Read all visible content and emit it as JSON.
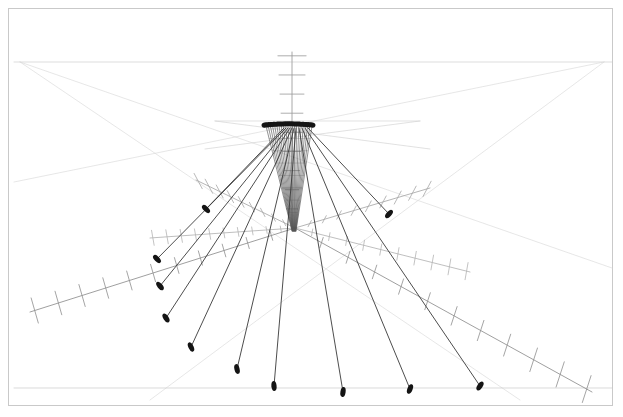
{
  "figure": {
    "title": "",
    "background_color": "#ffffff",
    "frame_color": "#c9c9c9",
    "frame_inset_px": 8,
    "width": 623,
    "height": 417
  },
  "chart_data": {
    "type": "scatter",
    "subtype": "3d-quiver-perspective",
    "title": "",
    "subtitle": "",
    "xlabel": "",
    "ylabel": "",
    "zlabel": "",
    "grid": false,
    "legend_position": "none",
    "annotations": [],
    "colors": {
      "vector_dark": "#3a3a3a",
      "vector_marker": "#141414",
      "axis_mid": "#8e8e8e",
      "axis_faint": "#cfcfcf",
      "horizon": "#c9c9c9",
      "cone_bundle": "#555555"
    },
    "view": {
      "projection": "perspective",
      "horizon_y": 62,
      "vanishing_left": [
        20,
        62
      ],
      "vanishing_right": [
        604,
        62
      ],
      "origin": [
        295,
        228
      ],
      "apex": [
        292,
        126
      ]
    },
    "axes": [
      {
        "name": "z-axis-vertical",
        "from": [
          292,
          228
        ],
        "to": [
          292,
          52
        ],
        "ticks": 9,
        "tick_len": 26,
        "tick_angle_deg": 0,
        "color": "#9a9a9a"
      },
      {
        "name": "axis-lower-left",
        "from": [
          295,
          228
        ],
        "to": [
          30,
          312
        ],
        "ticks": 11,
        "tick_len": 24,
        "tick_angle_deg": 74,
        "color": "#8e8e8e"
      },
      {
        "name": "axis-lower-right",
        "from": [
          295,
          228
        ],
        "to": [
          592,
          392
        ],
        "ticks": 11,
        "tick_len": 26,
        "tick_angle_deg": 108,
        "color": "#8e8e8e"
      },
      {
        "name": "axis-upper-left",
        "from": [
          295,
          228
        ],
        "to": [
          196,
          180
        ],
        "ticks": 9,
        "tick_len": 16,
        "tick_angle_deg": 62,
        "color": "#a8a8a8"
      },
      {
        "name": "axis-upper-right",
        "from": [
          295,
          228
        ],
        "to": [
          430,
          188
        ],
        "ticks": 9,
        "tick_len": 16,
        "tick_angle_deg": 118,
        "color": "#a8a8a8"
      },
      {
        "name": "axis-mid-left",
        "from": [
          295,
          228
        ],
        "to": [
          150,
          238
        ],
        "ticks": 10,
        "tick_len": 14,
        "tick_angle_deg": 80,
        "color": "#b4b4b4"
      },
      {
        "name": "axis-mid-right",
        "from": [
          295,
          228
        ],
        "to": [
          470,
          272
        ],
        "ticks": 10,
        "tick_len": 16,
        "tick_angle_deg": 100,
        "color": "#b4b4b4"
      }
    ],
    "horizon_lines": [
      {
        "name": "horizon",
        "from": [
          14,
          62
        ],
        "to": [
          612,
          62
        ],
        "color": "#c9c9c9"
      },
      {
        "name": "perspective-ray-a",
        "from": [
          20,
          62
        ],
        "to": [
          612,
          268
        ],
        "color": "#d8d8d8"
      },
      {
        "name": "perspective-ray-b",
        "from": [
          20,
          62
        ],
        "to": [
          520,
          400
        ],
        "color": "#d8d8d8"
      },
      {
        "name": "perspective-ray-c",
        "from": [
          604,
          62
        ],
        "to": [
          14,
          182
        ],
        "color": "#d8d8d8"
      },
      {
        "name": "perspective-ray-d",
        "from": [
          604,
          62
        ],
        "to": [
          150,
          400
        ],
        "color": "#d8d8d8"
      },
      {
        "name": "plane-edge-near",
        "from": [
          14,
          388
        ],
        "to": [
          612,
          388
        ],
        "color": "#c4c4c4"
      },
      {
        "name": "plane-edge-upper",
        "from": [
          215,
          121
        ],
        "to": [
          420,
          121
        ],
        "color": "#d0d0d0"
      },
      {
        "name": "plane-diag-left",
        "from": [
          215,
          121
        ],
        "to": [
          430,
          149
        ],
        "color": "#d0d0d0"
      },
      {
        "name": "plane-diag-right",
        "from": [
          420,
          121
        ],
        "to": [
          205,
          149
        ],
        "color": "#d0d0d0"
      }
    ],
    "vectors": [
      {
        "id": 1,
        "from": [
          286,
          128
        ],
        "to": [
          157,
          259
        ],
        "head_angle_deg": 46,
        "weight": 1.0
      },
      {
        "id": 2,
        "from": [
          288,
          128
        ],
        "to": [
          160,
          286
        ],
        "head_angle_deg": 51,
        "weight": 1.0
      },
      {
        "id": 3,
        "from": [
          290,
          128
        ],
        "to": [
          166,
          318
        ],
        "head_angle_deg": 57,
        "weight": 1.0
      },
      {
        "id": 4,
        "from": [
          292,
          128
        ],
        "to": [
          191,
          347
        ],
        "head_angle_deg": 65,
        "weight": 1.0
      },
      {
        "id": 5,
        "from": [
          294,
          128
        ],
        "to": [
          237,
          369
        ],
        "head_angle_deg": 77,
        "weight": 1.0
      },
      {
        "id": 6,
        "from": [
          296,
          128
        ],
        "to": [
          274,
          386
        ],
        "head_angle_deg": 85,
        "weight": 1.0
      },
      {
        "id": 7,
        "from": [
          299,
          128
        ],
        "to": [
          343,
          392
        ],
        "head_angle_deg": 99,
        "weight": 1.0
      },
      {
        "id": 8,
        "from": [
          302,
          128
        ],
        "to": [
          410,
          389
        ],
        "head_angle_deg": 112,
        "weight": 1.0
      },
      {
        "id": 9,
        "from": [
          305,
          128
        ],
        "to": [
          480,
          386
        ],
        "head_angle_deg": 124,
        "weight": 1.0
      },
      {
        "id": 10,
        "from": [
          284,
          128
        ],
        "to": [
          206,
          209
        ],
        "head_angle_deg": 44,
        "weight": 0.85
      },
      {
        "id": 11,
        "from": [
          308,
          128
        ],
        "to": [
          389,
          214
        ],
        "head_angle_deg": 132,
        "weight": 0.85
      }
    ],
    "cluster": {
      "name": "marker-cluster-top",
      "count": 17,
      "x_start": 265,
      "x_end": 312,
      "y": 125,
      "marker_w": 7,
      "marker_h": 5,
      "color": "#141414"
    },
    "cone": {
      "name": "converging-bundle",
      "apex": [
        294,
        231
      ],
      "top_left": [
        266,
        126
      ],
      "top_right": [
        312,
        126
      ],
      "strands": 22,
      "color": "#555555"
    }
  },
  "accessibility": {
    "figure_role": "3D perspective vector plot with radiating tick-marked axes"
  }
}
